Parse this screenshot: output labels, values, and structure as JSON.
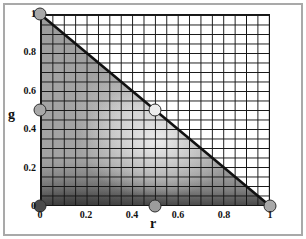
{
  "figure": {
    "frame_border_color": "#a9a9a9",
    "background_color": "#ffffff",
    "grid_line_color": "#151515",
    "boundary_line_color": "#111111",
    "marker_outline_color": "#2e2e2e"
  },
  "chart_data": {
    "type": "scatter",
    "title": "",
    "xlabel": "r",
    "ylabel": "g",
    "xlim": [
      0,
      1
    ],
    "ylim": [
      0,
      1
    ],
    "x_ticks": [
      {
        "value": 0,
        "label": "0"
      },
      {
        "value": 0.2,
        "label": "0.2"
      },
      {
        "value": 0.4,
        "label": "0.4"
      },
      {
        "value": 0.6,
        "label": "0.6"
      },
      {
        "value": 0.8,
        "label": "0.8"
      },
      {
        "value": 1,
        "label": "1"
      }
    ],
    "y_ticks": [
      {
        "value": 1,
        "label": "1"
      },
      {
        "value": 0.8,
        "label": "0.8"
      },
      {
        "value": 0.6,
        "label": "0.6"
      },
      {
        "value": 0.4,
        "label": "0.4"
      },
      {
        "value": 0.2,
        "label": "0.2"
      },
      {
        "value": 0,
        "label": "0"
      }
    ],
    "grid": {
      "on": true,
      "spacing": 0.05
    },
    "boundary_line": {
      "name": "r+g=1",
      "from": [
        0,
        1
      ],
      "to": [
        1,
        0
      ],
      "width": 2.6
    },
    "points": [
      {
        "r": 0,
        "g": 1,
        "fill": "#a8a8a8"
      },
      {
        "r": 0,
        "g": 0.5,
        "fill": "#a8a8a8"
      },
      {
        "r": 0,
        "g": 0,
        "fill": "#4a4a4a"
      },
      {
        "r": 0.5,
        "g": 0.5,
        "fill": "#ededed"
      },
      {
        "r": 0.5,
        "g": 0,
        "fill": "#9c9c9c"
      },
      {
        "r": 1,
        "g": 0,
        "fill": "#a8a8a8"
      }
    ],
    "shaded_region": {
      "shape": "triangle r+g<=1",
      "shading": "grayscale gradient: dark band along bottom (darkest at lower-left corner), medium gray interior, bright spot near (r=0.5, g=0.33)"
    }
  }
}
